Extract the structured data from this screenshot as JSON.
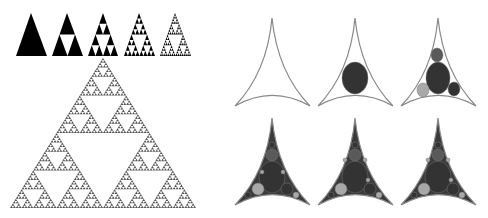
{
  "figure": {
    "background": "#ffffff",
    "sierpinski": {
      "fill_color": "#000000",
      "large_color": "#555555",
      "iterations": [
        {
          "level": 0,
          "apex": [
            31,
            13
          ],
          "left": [
            16,
            56
          ],
          "right": [
            47,
            56
          ]
        },
        {
          "level": 1,
          "apex": [
            67,
            13
          ],
          "left": [
            52,
            56
          ],
          "right": [
            83,
            56
          ]
        },
        {
          "level": 2,
          "apex": [
            103,
            13
          ],
          "left": [
            88,
            56
          ],
          "right": [
            118,
            56
          ]
        },
        {
          "level": 3,
          "apex": [
            139,
            13
          ],
          "left": [
            124,
            56
          ],
          "right": [
            155,
            56
          ]
        },
        {
          "level": 4,
          "apex": [
            175,
            13
          ],
          "left": [
            160,
            56
          ],
          "right": [
            191,
            56
          ]
        }
      ],
      "large": {
        "level": 6,
        "apex": [
          103,
          58
        ],
        "left": [
          10,
          208
        ],
        "right": [
          196,
          208
        ]
      }
    },
    "apollonian": {
      "outline_color": "#888888",
      "fill_color": "#3a3a3a",
      "shades": {
        "dark": "#333333",
        "mid": "#5a5a5a",
        "light": "#a8a8a8"
      },
      "panels": [
        {
          "id": "a1",
          "apex": [
            272,
            18
          ],
          "left": [
            235,
            106
          ],
          "right": [
            310,
            106
          ],
          "filled": false,
          "circles": []
        },
        {
          "id": "a2",
          "apex": [
            355,
            18
          ],
          "left": [
            318,
            106
          ],
          "right": [
            393,
            106
          ],
          "filled": false,
          "circles": [
            {
              "cx": 355,
              "cy": 78,
              "rx": 13,
              "ry": 16,
              "shade": "dark"
            }
          ]
        },
        {
          "id": "a3",
          "apex": [
            438,
            18
          ],
          "left": [
            401,
            106
          ],
          "right": [
            476,
            106
          ],
          "filled": false,
          "circles": [
            {
              "cx": 438,
              "cy": 78,
              "rx": 12,
              "ry": 16,
              "shade": "dark"
            },
            {
              "cx": 437,
              "cy": 55,
              "rx": 6,
              "ry": 7,
              "shade": "mid"
            },
            {
              "cx": 423,
              "cy": 90,
              "rx": 6,
              "ry": 7,
              "shade": "light"
            },
            {
              "cx": 454,
              "cy": 89,
              "rx": 6,
              "ry": 7,
              "shade": "dark"
            }
          ]
        },
        {
          "id": "b1",
          "apex": [
            272,
            118
          ],
          "left": [
            235,
            205
          ],
          "right": [
            310,
            205
          ],
          "filled": true,
          "circles": [
            {
              "cx": 272,
              "cy": 177,
              "rx": 13,
              "ry": 16,
              "shade": "dark"
            },
            {
              "cx": 272,
              "cy": 155,
              "rx": 6,
              "ry": 6,
              "shade": "mid"
            },
            {
              "cx": 272,
              "cy": 145,
              "rx": 3,
              "ry": 3,
              "shade": "dark"
            },
            {
              "cx": 258,
              "cy": 189,
              "rx": 6,
              "ry": 6,
              "shade": "light"
            },
            {
              "cx": 287,
              "cy": 189,
              "rx": 6,
              "ry": 6,
              "shade": "dark"
            },
            {
              "cx": 248,
              "cy": 195,
              "rx": 3,
              "ry": 3,
              "shade": "dark"
            },
            {
              "cx": 296,
              "cy": 195,
              "rx": 3,
              "ry": 3,
              "shade": "light"
            },
            {
              "cx": 262,
              "cy": 172,
              "rx": 2,
              "ry": 2,
              "shade": "light"
            },
            {
              "cx": 283,
              "cy": 172,
              "rx": 2,
              "ry": 2,
              "shade": "light"
            }
          ]
        },
        {
          "id": "b2",
          "apex": [
            355,
            118
          ],
          "left": [
            318,
            205
          ],
          "right": [
            393,
            205
          ],
          "filled": true,
          "circles": [
            {
              "cx": 355,
              "cy": 177,
              "rx": 13,
              "ry": 16,
              "shade": "dark"
            },
            {
              "cx": 355,
              "cy": 155,
              "rx": 6,
              "ry": 6,
              "shade": "mid"
            },
            {
              "cx": 355,
              "cy": 145,
              "rx": 3,
              "ry": 3,
              "shade": "dark"
            },
            {
              "cx": 341,
              "cy": 189,
              "rx": 6,
              "ry": 6,
              "shade": "light"
            },
            {
              "cx": 370,
              "cy": 189,
              "rx": 6,
              "ry": 6,
              "shade": "dark"
            },
            {
              "cx": 331,
              "cy": 195,
              "rx": 3,
              "ry": 3,
              "shade": "dark"
            },
            {
              "cx": 379,
              "cy": 195,
              "rx": 3,
              "ry": 3,
              "shade": "light"
            },
            {
              "cx": 345,
              "cy": 160,
              "rx": 2,
              "ry": 2,
              "shade": "light"
            },
            {
              "cx": 365,
              "cy": 160,
              "rx": 2,
              "ry": 2,
              "shade": "light"
            },
            {
              "cx": 368,
              "cy": 180,
              "rx": 2,
              "ry": 2,
              "shade": "light"
            }
          ]
        },
        {
          "id": "b3",
          "apex": [
            438,
            118
          ],
          "left": [
            401,
            205
          ],
          "right": [
            476,
            205
          ],
          "filled": true,
          "circles": [
            {
              "cx": 438,
              "cy": 177,
              "rx": 13,
              "ry": 16,
              "shade": "dark"
            },
            {
              "cx": 438,
              "cy": 155,
              "rx": 6,
              "ry": 6,
              "shade": "mid"
            },
            {
              "cx": 438,
              "cy": 145,
              "rx": 3,
              "ry": 3,
              "shade": "dark"
            },
            {
              "cx": 424,
              "cy": 189,
              "rx": 6,
              "ry": 6,
              "shade": "light"
            },
            {
              "cx": 453,
              "cy": 189,
              "rx": 6,
              "ry": 6,
              "shade": "dark"
            },
            {
              "cx": 414,
              "cy": 195,
              "rx": 3,
              "ry": 3,
              "shade": "dark"
            },
            {
              "cx": 462,
              "cy": 195,
              "rx": 3,
              "ry": 3,
              "shade": "light"
            },
            {
              "cx": 428,
              "cy": 160,
              "rx": 2,
              "ry": 2,
              "shade": "light"
            },
            {
              "cx": 448,
              "cy": 160,
              "rx": 2,
              "ry": 2,
              "shade": "light"
            },
            {
              "cx": 451,
              "cy": 180,
              "rx": 2,
              "ry": 2,
              "shade": "light"
            }
          ]
        }
      ]
    }
  }
}
